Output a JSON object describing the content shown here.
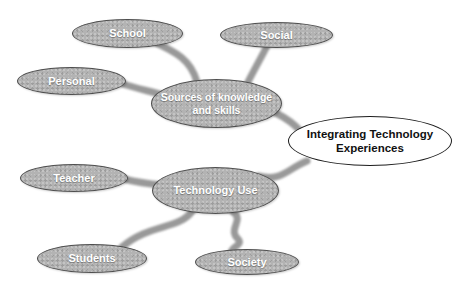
{
  "diagram": {
    "type": "mind-map",
    "background": "#ffffff",
    "colors": {
      "node_fill": "#b3b3b3",
      "node_border": "#4f4f4f",
      "node_text": "#ffffff",
      "center_fill": "#ffffff",
      "center_border": "#1c1c1c",
      "center_text": "#111111",
      "connector": "#8e8e8e"
    },
    "nodes": [
      {
        "id": "school",
        "label": "School"
      },
      {
        "id": "social",
        "label": "Social"
      },
      {
        "id": "personal",
        "label": "Personal"
      },
      {
        "id": "sources",
        "label": "Sources of knowledge and skills"
      },
      {
        "id": "integrating",
        "label": "Integrating Technology Experiences"
      },
      {
        "id": "teacher",
        "label": "Teacher"
      },
      {
        "id": "technology-use",
        "label": "Technology Use"
      },
      {
        "id": "students",
        "label": "Students"
      },
      {
        "id": "society",
        "label": "Society"
      }
    ],
    "edges": [
      {
        "from": "school",
        "to": "sources"
      },
      {
        "from": "social",
        "to": "sources"
      },
      {
        "from": "personal",
        "to": "sources"
      },
      {
        "from": "sources",
        "to": "integrating"
      },
      {
        "from": "technology-use",
        "to": "integrating"
      },
      {
        "from": "teacher",
        "to": "technology-use"
      },
      {
        "from": "technology-use",
        "to": "students"
      },
      {
        "from": "technology-use",
        "to": "society"
      }
    ]
  }
}
